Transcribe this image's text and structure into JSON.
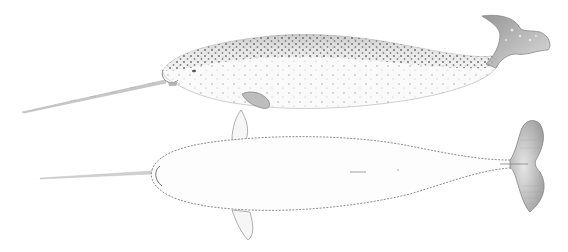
{
  "image": {
    "subject": "Narwhal illustration",
    "views": [
      {
        "name": "lateral view",
        "position": "top"
      },
      {
        "name": "dorsal view",
        "position": "bottom"
      }
    ],
    "colors": {
      "background": "#ffffff",
      "spots": "#6e6e6e",
      "outline": "#8a8a8a",
      "tusk": "#b4b4b4",
      "belly": "#f4f4f4"
    }
  }
}
